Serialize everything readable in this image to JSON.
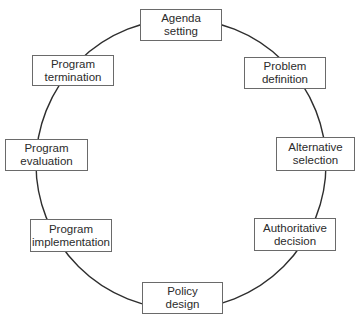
{
  "diagram": {
    "type": "cycle",
    "stroke_color": "#2e2e2e",
    "border_color": "#6a6a6a",
    "text_color": "#2b2b2b",
    "nodes": [
      {
        "id": "agenda",
        "line1": "Agenda",
        "line2": "setting"
      },
      {
        "id": "problem",
        "line1": "Problem",
        "line2": "definition"
      },
      {
        "id": "alternative",
        "line1": "Alternative",
        "line2": "selection"
      },
      {
        "id": "authoritative",
        "line1": "Authoritative",
        "line2": "decision"
      },
      {
        "id": "policy",
        "line1": "Policy",
        "line2": "design"
      },
      {
        "id": "implementation",
        "line1": "Program",
        "line2": "implementation"
      },
      {
        "id": "evaluation",
        "line1": "Program",
        "line2": "evaluation"
      },
      {
        "id": "termination",
        "line1": "Program",
        "line2": "termination"
      }
    ]
  }
}
